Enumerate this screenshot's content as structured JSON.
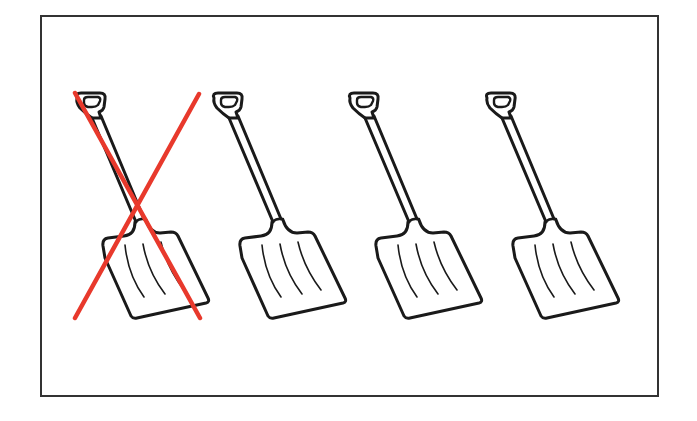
{
  "figure": {
    "description": "Four identical snow shovels in a bordered frame; the first shovel is crossed out with a red X",
    "shovel_count": 4,
    "crossed_out_count": 1,
    "remaining_count": 3,
    "colors": {
      "frame_border": "#333333",
      "outline": "#1a1a1a",
      "cross": "#e8392c",
      "background": "#ffffff"
    },
    "items": [
      {
        "label": "shovel-1",
        "crossed_out": true,
        "offset_x": 0
      },
      {
        "label": "shovel-2",
        "crossed_out": false,
        "offset_x": 137
      },
      {
        "label": "shovel-3",
        "crossed_out": false,
        "offset_x": 273
      },
      {
        "label": "shovel-4",
        "crossed_out": false,
        "offset_x": 410
      }
    ]
  }
}
